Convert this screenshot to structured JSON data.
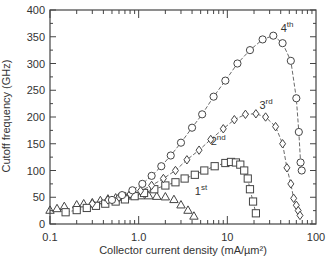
{
  "chart_data": {
    "type": "scatter",
    "title": "",
    "xlabel": "Collector current density (mA/µm²)",
    "ylabel": "Cutoff frequency (GHz)",
    "xscale": "log",
    "xlim": [
      0.1,
      100
    ],
    "ylim": [
      0,
      400
    ],
    "xticks": [
      "0.1",
      "1.0",
      "10",
      "100"
    ],
    "yticks": [
      "0",
      "50",
      "100",
      "150",
      "200",
      "250",
      "300",
      "350",
      "400"
    ],
    "grid": false,
    "legend": "inline labels",
    "series": [
      {
        "name": "1st",
        "marker": "triangle",
        "connected": false,
        "label_pos": [
          4.3,
          55
        ],
        "x": [
          0.1,
          0.12,
          0.145,
          0.2,
          0.24,
          0.3,
          0.37,
          0.45,
          0.55,
          0.7,
          0.85,
          1.05,
          1.3,
          1.6,
          2.0,
          2.5,
          3.0,
          3.6,
          4.2
        ],
        "y": [
          26,
          29,
          33,
          36,
          38,
          40,
          44,
          47,
          49,
          52,
          53,
          53,
          53,
          52,
          51,
          46,
          36,
          26,
          15
        ]
      },
      {
        "name": "2nd",
        "marker": "square",
        "connected": true,
        "label_pos": [
          6.5,
          148
        ],
        "x": [
          0.15,
          0.2,
          0.26,
          0.33,
          0.42,
          0.55,
          0.7,
          0.9,
          1.15,
          1.5,
          2.0,
          2.6,
          3.3,
          4.3,
          5.5,
          7.2,
          9.5,
          11,
          12.5,
          14,
          15.5,
          17,
          18,
          19.5,
          21
        ],
        "y": [
          22,
          26,
          30,
          34,
          38,
          42,
          46,
          52,
          58,
          65,
          72,
          78,
          85,
          92,
          100,
          108,
          114,
          116,
          115,
          111,
          100,
          85,
          65,
          42,
          20
        ]
      },
      {
        "name": "3rd",
        "marker": "diamond",
        "connected": true,
        "label_pos": [
          23,
          215
        ],
        "x": [
          0.3,
          0.45,
          0.6,
          0.8,
          1.05,
          1.4,
          1.9,
          2.6,
          3.5,
          4.8,
          6.5,
          9.0,
          12,
          16,
          21,
          27,
          35,
          42,
          47,
          52,
          56,
          60,
          63,
          66
        ],
        "y": [
          38,
          45,
          50,
          56,
          62,
          72,
          85,
          100,
          120,
          138,
          158,
          178,
          195,
          205,
          206,
          200,
          182,
          150,
          105,
          75,
          48,
          35,
          25,
          16
        ]
      },
      {
        "name": "4th",
        "marker": "circle",
        "connected": true,
        "label_pos": [
          40,
          358
        ],
        "x": [
          0.5,
          0.65,
          0.85,
          1.1,
          1.4,
          1.8,
          2.3,
          3.0,
          4.0,
          5.2,
          7.0,
          9.5,
          13,
          18,
          25,
          33,
          42,
          52,
          60,
          64,
          67,
          69
        ],
        "y": [
          45,
          54,
          63,
          75,
          90,
          108,
          128,
          152,
          180,
          205,
          238,
          268,
          300,
          325,
          345,
          352,
          338,
          305,
          235,
          172,
          115,
          100
        ]
      }
    ]
  },
  "labels": {
    "ylabel": "Cutoff frequency (GHz)",
    "xlabel": "Collector current density (mA/µm²)",
    "series": [
      "1",
      "2",
      "3",
      "4"
    ],
    "suffixes": [
      "st",
      "nd",
      "rd",
      "th"
    ]
  },
  "colors": {
    "axis": "#444444",
    "marker": "#444444",
    "text": "#333333"
  }
}
